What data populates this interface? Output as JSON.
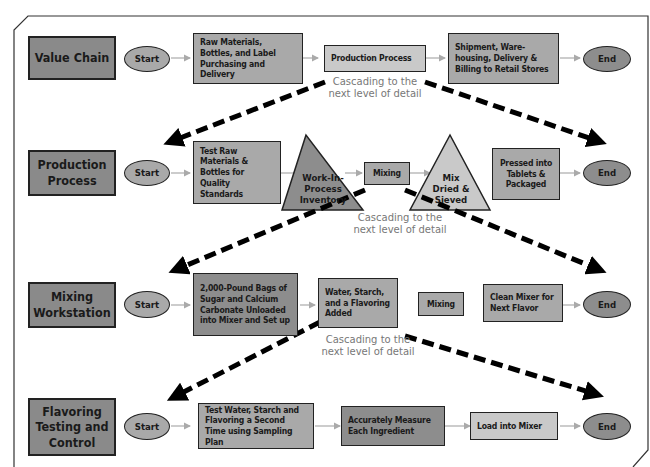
{
  "rows": [
    {
      "label": "Value Chain",
      "start": "Start",
      "end": "End",
      "steps": [
        "Raw Materials, Bottles, and Label Purchasing and Delivery",
        "Production Process",
        "Shipment, Ware-housing, Delivery & Billing to Retail Stores"
      ]
    },
    {
      "label": "Production Process",
      "start": "Start",
      "end": "End",
      "steps": [
        "Test Raw Materials & Bottles for Quality Standards",
        "Work-In-Process Inventory",
        "Mixing",
        "Mix Dried & Sieved",
        "Pressed into Tablets & Packaged"
      ]
    },
    {
      "label": "Mixing Workstation",
      "start": "Start",
      "end": "End",
      "steps": [
        "2,000-Pound Bags of Sugar and Calcium Carbonate Unloaded into Mixer and Set up",
        "Water, Starch, and a Flavoring Added",
        "Mixing",
        "Clean Mixer for Next Flavor"
      ]
    },
    {
      "label": "Flavoring Testing and Control",
      "start": "Start",
      "end": "End",
      "steps": [
        "Test Water, Starch and Flavoring a Second Time using Sampling Plan",
        "Accurately Measure Each Ingredient",
        "Load into Mixer"
      ]
    }
  ],
  "cascade_text": [
    "Cascading to the next level of detail",
    "Cascading to the next level of detail",
    "Cascading to the next level of detail"
  ],
  "colors": {
    "dark": "#8d8d8d",
    "mid": "#a9a9a9",
    "light": "#c9c9c9",
    "arrow": "#aaaaaa",
    "dashed": "#000000"
  }
}
